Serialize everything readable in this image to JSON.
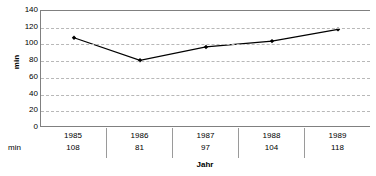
{
  "chart_data": {
    "type": "line",
    "title": "",
    "xlabel": "Jahr",
    "ylabel": "min",
    "categories": [
      "1985",
      "1986",
      "1987",
      "1988",
      "1989"
    ],
    "values": [
      108,
      81,
      97,
      104,
      118
    ],
    "series": [
      {
        "name": "min",
        "values": [
          108,
          81,
          97,
          104,
          118
        ]
      }
    ],
    "ylim": [
      0,
      140
    ],
    "yticks": [
      0,
      20,
      40,
      60,
      80,
      100,
      120,
      140
    ],
    "ytick_labels": [
      "0",
      "20",
      "40",
      "60",
      "80",
      "100",
      "120",
      "140"
    ],
    "grid": "horizontal-dashed",
    "legend": "none",
    "marker": "diamond",
    "line_color": "#000000",
    "marker_color": "#000000",
    "grid_color": "#b8b8b8",
    "axis_color": "#808080",
    "data_table": {
      "row_label": "min",
      "columns": [
        "1985",
        "1986",
        "1987",
        "1988",
        "1989"
      ],
      "values": [
        "108",
        "81",
        "97",
        "104",
        "118"
      ]
    }
  }
}
